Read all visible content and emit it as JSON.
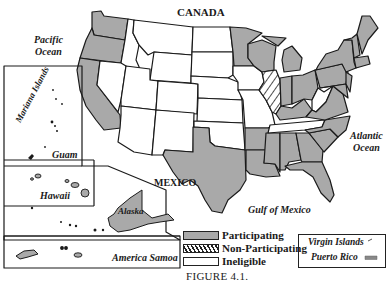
{
  "figure": {
    "caption": "FIGURE 4.1.",
    "type": "choropleth map of US states and territories by participation status"
  },
  "labels": {
    "canada": "CANADA",
    "mexico": "MEXICO",
    "pacific": "Pacific\nOcean",
    "pacific_l1": "Pacific",
    "pacific_l2": "Ocean",
    "atlantic_l1": "Atlantic",
    "atlantic_l2": "Ocean",
    "gulf": "Gulf of Mexico",
    "mariana": "Mariana Islands",
    "guam": "Guam",
    "hawaii": "Hawaii",
    "alaska": "Alaska",
    "samoa": "America Samoa",
    "virgin_islands": "Virgin Islands",
    "puerto_rico": "Puerto Rico"
  },
  "legend": {
    "items": [
      {
        "label": "Participating",
        "fill": "#a9a9a9",
        "pattern": "solid"
      },
      {
        "label": "Non-Participating",
        "fill": "#ffffff",
        "pattern": "hatched"
      },
      {
        "label": "Ineligible",
        "fill": "#ffffff",
        "pattern": "none"
      }
    ]
  },
  "colors": {
    "participating": "#a9a9a9",
    "ineligible": "#ffffff",
    "border": "#1a1a1a"
  },
  "status": {
    "participating": [
      "Washington",
      "Oregon",
      "California",
      "Minnesota",
      "Wisconsin",
      "Michigan",
      "Texas",
      "Louisiana",
      "Mississippi",
      "Alabama",
      "Georgia",
      "Florida",
      "South Carolina",
      "North Carolina",
      "Virginia",
      "Maryland",
      "Delaware",
      "New Jersey",
      "Pennsylvania",
      "New York",
      "Connecticut",
      "Rhode Island",
      "Massachusetts",
      "Vermont",
      "New Hampshire",
      "Maine",
      "Ohio",
      "Indiana",
      "Kentucky",
      "Arkansas",
      "Alaska",
      "Hawaii",
      "Guam",
      "America Samoa",
      "Puerto Rico",
      "Virgin Islands"
    ],
    "non_participating": [
      "Illinois"
    ],
    "ineligible": [
      "Idaho",
      "Montana",
      "Wyoming",
      "Nevada",
      "Utah",
      "Colorado",
      "Arizona",
      "New Mexico",
      "North Dakota",
      "South Dakota",
      "Nebraska",
      "Kansas",
      "Oklahoma",
      "Iowa",
      "Missouri",
      "Tennessee",
      "West Virginia",
      "Mariana Islands"
    ]
  }
}
